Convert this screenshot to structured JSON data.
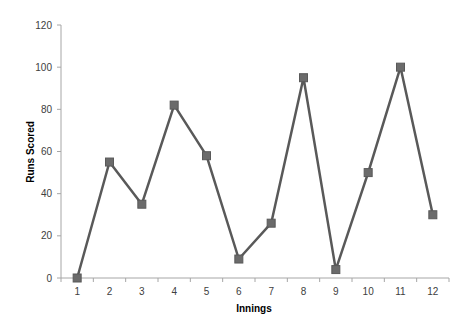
{
  "chart_data": {
    "type": "line",
    "title": "",
    "xlabel": "Innings",
    "ylabel": "Runs Scored",
    "categories": [
      "1",
      "2",
      "3",
      "4",
      "5",
      "6",
      "7",
      "8",
      "9",
      "10",
      "11",
      "12"
    ],
    "series": [
      {
        "name": "Runs Scored",
        "values": [
          0,
          55,
          35,
          82,
          58,
          9,
          26,
          95,
          4,
          50,
          100,
          30
        ],
        "color": "#595959",
        "marker": "square"
      }
    ],
    "ylim": [
      0,
      120
    ],
    "yticks": [
      0,
      20,
      40,
      60,
      80,
      100,
      120
    ],
    "grid": false,
    "legend": null
  }
}
